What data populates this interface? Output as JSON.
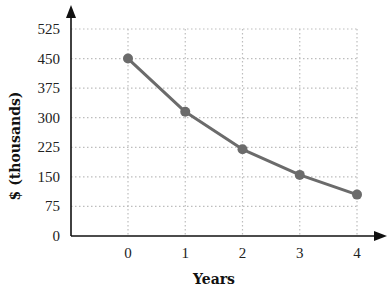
{
  "chart_data": {
    "type": "line",
    "title": "",
    "xlabel": "Years",
    "ylabel": "$ (thousands)",
    "x": [
      0,
      1,
      2,
      3,
      4
    ],
    "categories": [
      "0",
      "1",
      "2",
      "3",
      "4"
    ],
    "series": [
      {
        "name": "Value",
        "values": [
          450,
          315,
          220,
          155,
          105
        ]
      }
    ],
    "y_ticks": [
      0,
      75,
      150,
      225,
      300,
      375,
      450,
      525
    ],
    "ylim": [
      0,
      525
    ],
    "xlim": [
      -1,
      4
    ],
    "grid": true,
    "grid_style": "dotted",
    "legend": null,
    "colors": {
      "line": "#6b6b6b",
      "marker": "#6b6b6b",
      "axis": "#111111",
      "grid": "#bdbdbd"
    }
  }
}
